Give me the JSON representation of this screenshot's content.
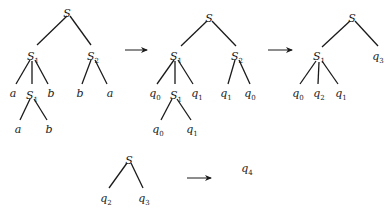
{
  "diagram": {
    "type": "tree-rewriting",
    "trees": [
      {
        "id": "tree1",
        "nodes": [
          {
            "id": "n0",
            "label": "S",
            "sub": "",
            "x": 67,
            "y": 13
          },
          {
            "id": "n1",
            "label": "S",
            "sub": "1",
            "x": 33,
            "y": 56
          },
          {
            "id": "n2",
            "label": "S",
            "sub": "2",
            "x": 93,
            "y": 56
          },
          {
            "id": "n3",
            "label": "a",
            "sub": "",
            "x": 13,
            "y": 93
          },
          {
            "id": "n4",
            "label": "S",
            "sub": "1",
            "x": 32,
            "y": 95
          },
          {
            "id": "n5",
            "label": "b",
            "sub": "",
            "x": 51,
            "y": 93
          },
          {
            "id": "n6",
            "label": "b",
            "sub": "",
            "x": 80,
            "y": 93
          },
          {
            "id": "n7",
            "label": "a",
            "sub": "",
            "x": 110,
            "y": 93
          },
          {
            "id": "n8",
            "label": "a",
            "sub": "",
            "x": 18,
            "y": 129
          },
          {
            "id": "n9",
            "label": "b",
            "sub": "",
            "x": 49,
            "y": 129
          }
        ],
        "edges": [
          [
            67,
            16,
            37,
            45
          ],
          [
            70,
            16,
            91,
            45
          ],
          [
            30,
            60,
            16,
            84
          ],
          [
            32,
            61,
            32,
            84
          ],
          [
            35,
            60,
            48,
            84
          ],
          [
            91,
            60,
            82,
            84
          ],
          [
            95,
            60,
            107,
            84
          ],
          [
            30,
            99,
            20,
            120
          ],
          [
            34,
            99,
            47,
            120
          ]
        ]
      },
      {
        "id": "tree2",
        "nodes": [
          {
            "id": "m0",
            "label": "S",
            "sub": "",
            "x": 209,
            "y": 18
          },
          {
            "id": "m1",
            "label": "S",
            "sub": "1",
            "x": 176,
            "y": 56
          },
          {
            "id": "m2",
            "label": "S",
            "sub": "2",
            "x": 237,
            "y": 56
          },
          {
            "id": "m3",
            "label": "q",
            "sub": "0",
            "x": 155,
            "y": 93
          },
          {
            "id": "m4",
            "label": "S",
            "sub": "1",
            "x": 176,
            "y": 95
          },
          {
            "id": "m5",
            "label": "q",
            "sub": "1",
            "x": 197,
            "y": 93
          },
          {
            "id": "m6",
            "label": "q",
            "sub": "1",
            "x": 226,
            "y": 93
          },
          {
            "id": "m7",
            "label": "q",
            "sub": "0",
            "x": 250,
            "y": 93
          },
          {
            "id": "m8",
            "label": "q",
            "sub": "0",
            "x": 158,
            "y": 129
          },
          {
            "id": "m9",
            "label": "q",
            "sub": "1",
            "x": 192,
            "y": 129
          }
        ],
        "edges": [
          [
            207,
            21,
            181,
            46
          ],
          [
            212,
            21,
            236,
            46
          ],
          [
            174,
            60,
            157,
            84
          ],
          [
            175,
            61,
            175,
            84
          ],
          [
            178,
            60,
            193,
            84
          ],
          [
            235,
            60,
            228,
            84
          ],
          [
            239,
            60,
            250,
            84
          ],
          [
            172,
            99,
            161,
            120
          ],
          [
            177,
            99,
            191,
            120
          ]
        ]
      },
      {
        "id": "tree3",
        "nodes": [
          {
            "id": "k0",
            "label": "S",
            "sub": "",
            "x": 352,
            "y": 18
          },
          {
            "id": "k1",
            "label": "S",
            "sub": "1",
            "x": 319,
            "y": 56
          },
          {
            "id": "k2",
            "label": "q",
            "sub": "3",
            "x": 378,
            "y": 56
          },
          {
            "id": "k3",
            "label": "q",
            "sub": "0",
            "x": 298,
            "y": 93
          },
          {
            "id": "k4",
            "label": "q",
            "sub": "2",
            "x": 319,
            "y": 93
          },
          {
            "id": "k5",
            "label": "q",
            "sub": "1",
            "x": 341,
            "y": 93
          }
        ],
        "edges": [
          [
            350,
            21,
            322,
            47
          ],
          [
            355,
            21,
            378,
            46
          ],
          [
            316,
            61,
            300,
            84
          ],
          [
            319,
            62,
            318,
            84
          ],
          [
            322,
            61,
            338,
            84
          ]
        ]
      },
      {
        "id": "tree4",
        "nodes": [
          {
            "id": "p0",
            "label": "S",
            "sub": "",
            "x": 129,
            "y": 160
          },
          {
            "id": "p1",
            "label": "q",
            "sub": "2",
            "x": 106,
            "y": 198
          },
          {
            "id": "p2",
            "label": "q",
            "sub": "3",
            "x": 144,
            "y": 198
          }
        ],
        "edges": [
          [
            127,
            163,
            109,
            188
          ],
          [
            131,
            163,
            143,
            188
          ]
        ]
      },
      {
        "id": "tree5",
        "nodes": [
          {
            "id": "r0",
            "label": "q",
            "sub": "4",
            "x": 247,
            "y": 168
          }
        ],
        "edges": []
      }
    ],
    "arrows": [
      {
        "id": "arrow1",
        "x1": 125,
        "y1": 50,
        "x2": 147,
        "y2": 50
      },
      {
        "id": "arrow2",
        "x1": 268,
        "y1": 50,
        "x2": 292,
        "y2": 50
      },
      {
        "id": "arrow3",
        "x1": 187,
        "y1": 178,
        "x2": 211,
        "y2": 178
      }
    ]
  }
}
